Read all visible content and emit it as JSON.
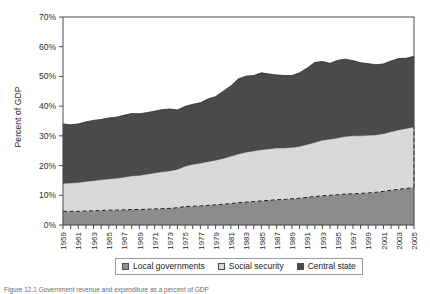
{
  "chart_data": {
    "type": "area",
    "title": "",
    "subtitle": "",
    "xlabel": "",
    "ylabel": "Percent of GDP",
    "ylim": [
      0,
      70
    ],
    "xlim": [
      1959,
      2005
    ],
    "grid": false,
    "stacked": true,
    "legend_position": "bottom",
    "y_ticks": [
      "0%",
      "10%",
      "20%",
      "30%",
      "40%",
      "50%",
      "60%",
      "70%"
    ],
    "y_tick_values": [
      0,
      10,
      20,
      30,
      40,
      50,
      60,
      70
    ],
    "x_tick_labels": [
      "1959",
      "1961",
      "1963",
      "1965",
      "1967",
      "1969",
      "1971",
      "1973",
      "1975",
      "1977",
      "1979",
      "1981",
      "1983",
      "1985",
      "1987",
      "1989",
      "1991",
      "1993",
      "1995",
      "1997",
      "1999",
      "2001",
      "2003",
      "2005"
    ],
    "x": [
      1959,
      1960,
      1961,
      1962,
      1963,
      1964,
      1965,
      1966,
      1967,
      1968,
      1969,
      1970,
      1971,
      1972,
      1973,
      1974,
      1975,
      1976,
      1977,
      1978,
      1979,
      1980,
      1981,
      1982,
      1983,
      1984,
      1985,
      1986,
      1987,
      1988,
      1989,
      1990,
      1991,
      1992,
      1993,
      1994,
      1995,
      1996,
      1997,
      1998,
      1999,
      2000,
      2001,
      2002,
      2003,
      2004,
      2005
    ],
    "series": [
      {
        "name": "Local governments",
        "color": "#8c8c8c",
        "values": [
          4.6,
          4.6,
          4.6,
          4.7,
          4.8,
          4.9,
          5.0,
          5.0,
          5.1,
          5.2,
          5.2,
          5.3,
          5.4,
          5.5,
          5.6,
          5.8,
          6.2,
          6.3,
          6.4,
          6.6,
          6.8,
          7.0,
          7.2,
          7.5,
          7.7,
          7.9,
          8.1,
          8.3,
          8.5,
          8.6,
          8.8,
          9.0,
          9.3,
          9.6,
          9.8,
          10.0,
          10.2,
          10.4,
          10.5,
          10.6,
          10.8,
          11.0,
          11.3,
          11.7,
          12.0,
          12.3,
          12.6
        ]
      },
      {
        "name": "Social security",
        "color": "#d9d9d9",
        "values": [
          9.4,
          9.5,
          9.7,
          9.9,
          10.1,
          10.3,
          10.5,
          10.7,
          11.0,
          11.3,
          11.5,
          11.8,
          12.1,
          12.4,
          12.6,
          12.9,
          13.6,
          14.1,
          14.4,
          14.7,
          15.0,
          15.4,
          15.9,
          16.4,
          16.8,
          17.0,
          17.2,
          17.3,
          17.4,
          17.3,
          17.3,
          17.4,
          17.8,
          18.2,
          18.7,
          18.9,
          19.1,
          19.4,
          19.5,
          19.4,
          19.4,
          19.3,
          19.4,
          19.7,
          20.0,
          20.2,
          20.4
        ]
      },
      {
        "name": "Central state",
        "color": "#4a4a4a",
        "values": [
          20.0,
          19.6,
          19.7,
          20.1,
          20.3,
          20.3,
          20.5,
          20.6,
          20.8,
          21.0,
          20.7,
          20.7,
          20.8,
          20.9,
          20.8,
          20.0,
          20.1,
          20.2,
          20.3,
          21.1,
          21.4,
          22.6,
          23.7,
          25.3,
          25.6,
          25.4,
          25.9,
          25.2,
          24.6,
          24.4,
          24.2,
          24.8,
          25.7,
          26.9,
          26.5,
          25.5,
          26.1,
          26.0,
          25.3,
          24.6,
          24.1,
          23.6,
          23.5,
          23.8,
          24.0,
          23.6,
          23.8
        ]
      }
    ],
    "totals": [
      34.0,
      33.7,
      34.0,
      34.7,
      35.2,
      35.5,
      36.0,
      36.3,
      36.9,
      37.5,
      37.4,
      37.8,
      38.3,
      38.8,
      39.0,
      38.7,
      39.9,
      40.6,
      41.1,
      42.4,
      43.2,
      45.0,
      46.8,
      49.2,
      50.1,
      50.3,
      51.2,
      50.8,
      50.5,
      50.3,
      50.3,
      51.2,
      52.8,
      54.7,
      55.0,
      54.4,
      55.4,
      55.8,
      55.3,
      54.6,
      54.3,
      53.9,
      54.2,
      55.2,
      56.0,
      56.1,
      56.8
    ]
  },
  "axes": {
    "y_title": "Percent of GDP"
  },
  "legend": {
    "items": [
      {
        "label": "Local governments",
        "color": "#8c8c8c"
      },
      {
        "label": "Social security",
        "color": "#d9d9d9"
      },
      {
        "label": "Central state",
        "color": "#4a4a4a"
      }
    ]
  },
  "caption": {
    "text": "Figure 12.1  Government revenue and expenditure as a percent of GDP"
  }
}
